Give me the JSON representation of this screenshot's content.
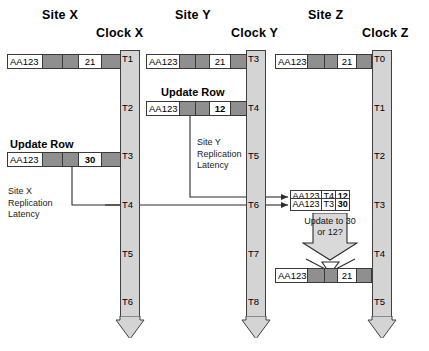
{
  "titles": {
    "site_x": "Site X",
    "site_y": "Site Y",
    "site_z": "Site Z",
    "clock_x": "Clock X",
    "clock_y": "Clock Y",
    "clock_z": "Clock Z"
  },
  "clocks": {
    "x": {
      "name": "Clock X",
      "ticks": [
        "T1",
        "T2",
        "T3",
        "T4",
        "T5",
        "T6"
      ]
    },
    "y": {
      "name": "Clock Y",
      "ticks": [
        "T3",
        "T4",
        "T5",
        "T6",
        "T7",
        "T8"
      ]
    },
    "z": {
      "name": "Clock Z",
      "ticks": [
        "T0",
        "T1",
        "T2",
        "T3",
        "T4",
        "T5"
      ]
    }
  },
  "captions": {
    "update_row_x": "Update Row",
    "update_row_y": "Update Row"
  },
  "notes": {
    "site_x_latency": "Site X\nReplication\nLatency",
    "site_y_latency": "Site Y\nReplication\nLatency",
    "update_question": "Update\nto\n30 or 12?"
  },
  "rows": {
    "x_initial": {
      "key": "AA123",
      "value": "21"
    },
    "x_updated": {
      "key": "AA123",
      "value": "30"
    },
    "y_initial": {
      "key": "AA123",
      "value": "21"
    },
    "y_updated": {
      "key": "AA123",
      "value": "12"
    },
    "z_initial": {
      "key": "AA123",
      "value": "21"
    },
    "z_final": {
      "key": "AA123",
      "value": "21"
    }
  },
  "z_queue": [
    {
      "key": "AA123",
      "ts": "T4",
      "value": "12"
    },
    {
      "key": "AA123",
      "ts": "T3",
      "value": "30"
    }
  ],
  "colors": {
    "row_gray": "#8f8f8f",
    "clock_gray": "#d4d4d4",
    "stroke": "#3a3a3a",
    "background": "#ffffff"
  }
}
